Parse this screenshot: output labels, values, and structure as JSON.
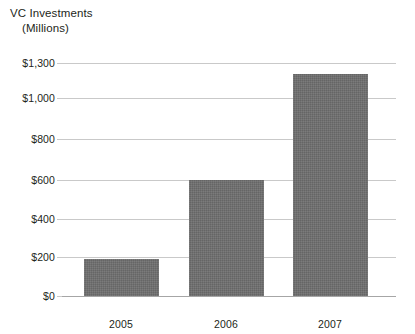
{
  "chart_data": {
    "type": "bar",
    "title": "VC Investments",
    "subtitle": "(Millions)",
    "xlabel": "",
    "ylabel": "VC Investments (Millions)",
    "categories": [
      "2005",
      "2006",
      "2007"
    ],
    "values": [
      190,
      600,
      1170
    ],
    "value_prefix": "$",
    "ytick_labels": [
      "$0",
      "$200",
      "$400",
      "$600",
      "$800",
      "$1,000",
      "$1,300"
    ],
    "ytick_values": [
      0,
      200,
      400,
      600,
      800,
      1000,
      1300
    ],
    "ytick_pixel_offsets": [
      241,
      202,
      164,
      125,
      84,
      43,
      8
    ],
    "ylim": [
      0,
      1300
    ],
    "grid": true,
    "legend": false,
    "bar_color": "#6e6e6e",
    "gridline_color": "#c9c9c9",
    "axis_color": "#a6a6a6",
    "text_color": "#231f20",
    "background_color": "#ffffff",
    "bars": [
      {
        "category": "2005",
        "value": 190,
        "x": 22,
        "width": 75,
        "top": 204,
        "height": 37
      },
      {
        "category": "2006",
        "value": 600,
        "x": 127,
        "width": 75,
        "top": 125,
        "height": 116
      },
      {
        "category": "2007",
        "value": 1170,
        "x": 231,
        "width": 75,
        "top": 19,
        "height": 222
      }
    ],
    "xtick_centers": [
      59,
      164,
      268
    ]
  }
}
